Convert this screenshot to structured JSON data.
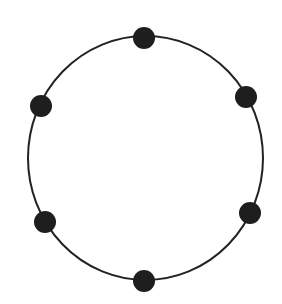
{
  "diagram": {
    "type": "ring-of-nodes",
    "node_count": 6,
    "ring": {
      "cx": 145.5,
      "cy": 158,
      "rx": 117.5,
      "ry": 122,
      "stroke": "#222222",
      "stroke_width": 2
    },
    "node_style": {
      "r": 11,
      "fill": "#1e1e1e"
    },
    "nodes": [
      {
        "id": "top",
        "x": 144,
        "y": 38
      },
      {
        "id": "upper-right",
        "x": 246,
        "y": 97
      },
      {
        "id": "lower-right",
        "x": 250,
        "y": 213
      },
      {
        "id": "bottom",
        "x": 144,
        "y": 281
      },
      {
        "id": "lower-left",
        "x": 45,
        "y": 222
      },
      {
        "id": "upper-left",
        "x": 41,
        "y": 106
      }
    ]
  }
}
